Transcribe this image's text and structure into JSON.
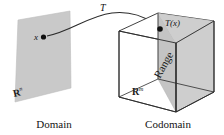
{
  "figure": {
    "kind": "linear-transformation-diagram",
    "background_color": "#ffffff",
    "plane_fill": "#c9c9c9",
    "range_fill": "#c4c4c4",
    "stroke_color": "#2b2b2b"
  },
  "labels": {
    "transformation": "T",
    "domain_point": "x",
    "codomain_point": "T(x)",
    "domain_space": "R",
    "domain_space_exponent": "n",
    "codomain_space": "R",
    "codomain_space_exponent": "m",
    "range": "Range",
    "domain_caption": "Domain",
    "codomain_caption": "Codomain"
  },
  "icons": {
    "arrow": "curved-arrow-icon",
    "domain_plane": "plane-icon",
    "codomain_cube": "cube-icon",
    "point_marker": "dot-icon"
  }
}
